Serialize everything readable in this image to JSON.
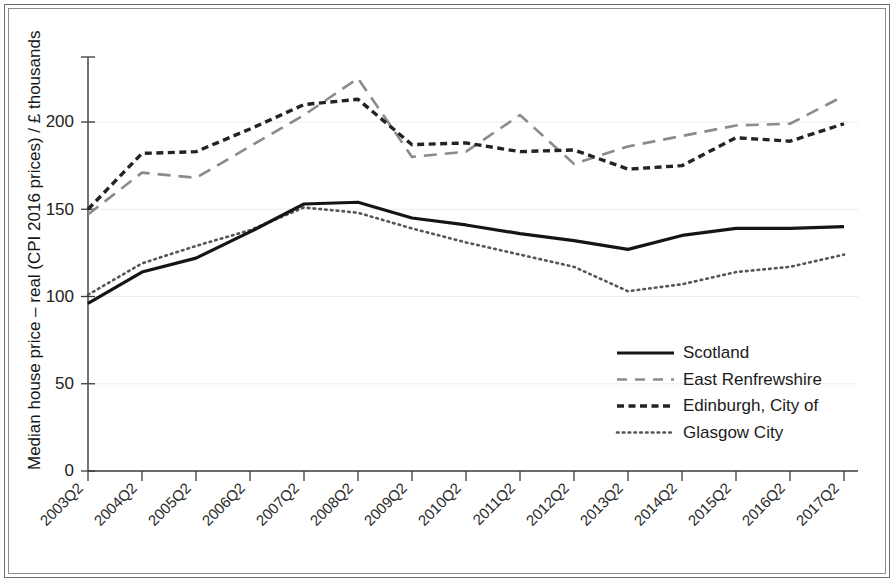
{
  "chart_data": {
    "type": "line",
    "title": "",
    "xlabel": "",
    "ylabel": "Median house price – real (CPI 2016 prices) / £ thousands",
    "categories": [
      "2003Q2",
      "2004Q2",
      "2005Q2",
      "2006Q2",
      "2007Q2",
      "2008Q2",
      "2009Q2",
      "2010Q2",
      "2011Q2",
      "2012Q2",
      "2013Q2",
      "2014Q2",
      "2015Q2",
      "2016Q2",
      "2017Q2"
    ],
    "ylim": [
      0,
      240
    ],
    "yticks": [
      0,
      50,
      100,
      150,
      200
    ],
    "ytick_labels": [
      "0",
      "50",
      "100",
      "150",
      "200"
    ],
    "grid": true,
    "legend_position": "center-right",
    "series": [
      {
        "name": "Scotland",
        "style": "solid",
        "color": "#151515",
        "values": [
          96,
          114,
          122,
          137,
          153,
          154,
          145,
          141,
          136,
          132,
          127,
          135,
          139,
          139,
          140
        ]
      },
      {
        "name": "East Renfrewshire",
        "style": "long-dash",
        "color": "#8b8b8b",
        "values": [
          147,
          171,
          168,
          186,
          204,
          225,
          180,
          183,
          204,
          176,
          186,
          192,
          198,
          199,
          215
        ]
      },
      {
        "name": "Edinburgh, City of",
        "style": "short-dash",
        "color": "#232323",
        "values": [
          150,
          182,
          183,
          196,
          210,
          213,
          187,
          188,
          183,
          184,
          173,
          175,
          191,
          189,
          199
        ]
      },
      {
        "name": "Glasgow City",
        "style": "dotted",
        "color": "#555555",
        "values": [
          101,
          119,
          129,
          138,
          151,
          148,
          139,
          131,
          124,
          117,
          103,
          107,
          114,
          117,
          124
        ]
      }
    ]
  }
}
